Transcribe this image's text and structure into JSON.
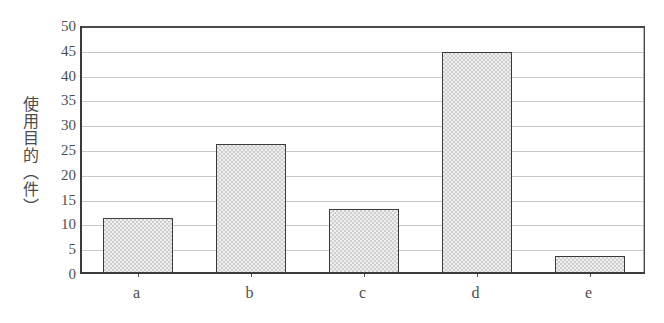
{
  "chart_data": {
    "type": "bar",
    "title": "",
    "subtitle": "",
    "xlabel": "",
    "ylabel": "使用目的（件）",
    "categories": [
      "a",
      "b",
      "c",
      "d",
      "e"
    ],
    "values": [
      11,
      26,
      13,
      44.5,
      3.5
    ],
    "series": [
      {
        "name": "使用目的",
        "values": [
          11,
          26,
          13,
          44.5,
          3.5
        ]
      }
    ],
    "ylim": [
      0,
      50
    ],
    "ytick_values": [
      0,
      5,
      10,
      15,
      20,
      25,
      30,
      35,
      40,
      45,
      50
    ],
    "ytick_labels": [
      "0",
      "5",
      "10",
      "15",
      "20",
      "25",
      "30",
      "35",
      "40",
      "45",
      "50"
    ],
    "ytick_step": 5,
    "grid": "horizontal",
    "legend": "none",
    "annotations": [],
    "bar_fill_color": "#dcdcdc",
    "bar_edge_color": "#3b3b3b",
    "axis_color": "#3a3a3a",
    "gridline_color": "#9a9a9a",
    "background_color": "#ffffff"
  }
}
